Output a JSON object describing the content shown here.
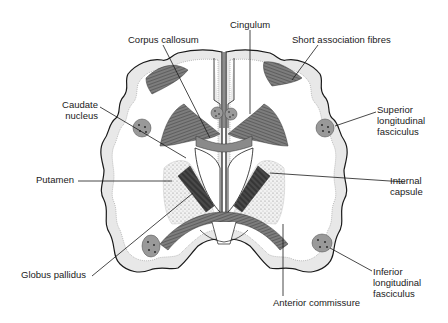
{
  "diagram": {
    "colors": {
      "background": "#ffffff",
      "outline": "#1a1a1a",
      "cortex_fill": "#e6e6e6",
      "fibre_fill": "#7a7a7a",
      "nucleus_stipple": "#d8d8d8",
      "bundle_fill": "#8c8c8c",
      "leader_line": "#1a1a1a"
    },
    "labels": {
      "corpus_callosum": "Corpus callosum",
      "cingulum": "Cingulum",
      "short_association": "Short association fibres",
      "caudate_1": "Caudate",
      "caudate_2": "nucleus",
      "superior_1": "Superior",
      "superior_2": "longitudinal",
      "superior_3": "fasciculus",
      "putamen": "Putamen",
      "internal_1": "Internal",
      "internal_2": "capsule",
      "globus": "Globus pallidus",
      "inferior_1": "Inferior",
      "inferior_2": "longitudinal",
      "inferior_3": "fasciculus",
      "anterior": "Anterior commissure"
    }
  }
}
